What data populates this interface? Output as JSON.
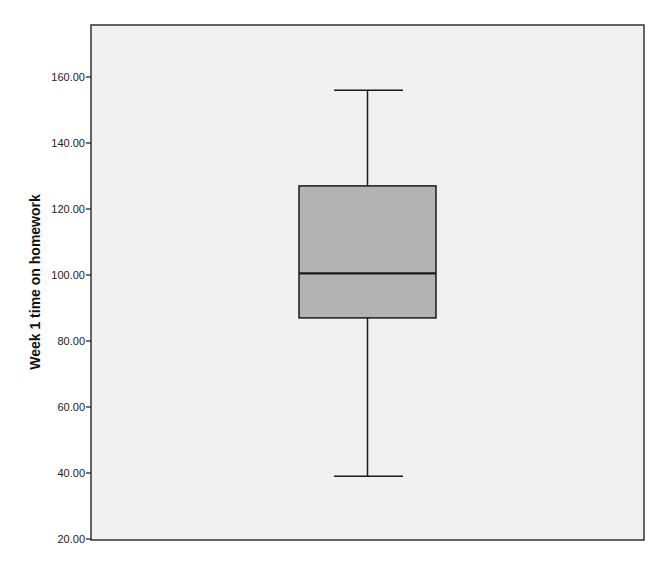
{
  "chart_data": {
    "type": "boxplot",
    "title": "",
    "xlabel": "",
    "ylabel": "Week 1 time on homework",
    "ylim": [
      20,
      175.8
    ],
    "yticks": [
      20,
      40,
      60,
      80,
      100,
      120,
      140,
      160
    ],
    "ytick_labels": [
      "20.00",
      "40.00",
      "60.00",
      "80.00",
      "100.00",
      "120.00",
      "140.00",
      "160.00"
    ],
    "grid": false,
    "legend": null,
    "series": [
      {
        "name": "Week 1 time on homework",
        "min": 39,
        "q1": 87,
        "median": 100.5,
        "q3": 127,
        "max": 156
      }
    ],
    "colors": {
      "plot_background": "#f1f1f1",
      "box_fill": "#b3b3b3",
      "lines": "#1a1a1a"
    }
  }
}
